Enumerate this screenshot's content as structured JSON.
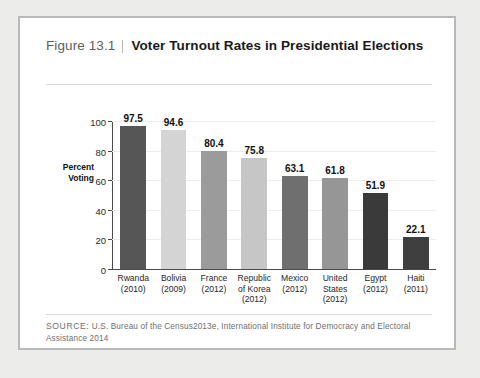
{
  "figure": {
    "number_label": "Figure 13.1",
    "title": "Voter Turnout Rates in Presidential Elections",
    "source_keyword": "SOURCE:",
    "source_text": " U.S. Bureau of the Census2013e, International Institute for Democracy and Electoral Assistance 2014"
  },
  "chart_data": {
    "type": "bar",
    "title": "Voter Turnout Rates in Presidential Elections",
    "xlabel": "",
    "ylabel": "Percent Voting",
    "ylabel_line1": "Percent",
    "ylabel_line2": "Voting",
    "ylim": [
      0,
      100
    ],
    "yticks": [
      0,
      20,
      40,
      60,
      80,
      100
    ],
    "ytick_labels": [
      "0",
      "20",
      "40",
      "60",
      "80",
      "100"
    ],
    "grid": true,
    "legend": "none",
    "categories": [
      "Rwanda (2010)",
      "Bolivia (2009)",
      "France (2012)",
      "Republic of Korea (2012)",
      "Mexico (2012)",
      "United States (2012)",
      "Egypt (2012)",
      "Haiti (2011)"
    ],
    "category_lines": [
      [
        "Rwanda",
        "(2010)"
      ],
      [
        "Bolivia",
        "(2009)"
      ],
      [
        "France",
        "(2012)"
      ],
      [
        "Republic",
        "of Korea",
        "(2012)"
      ],
      [
        "Mexico",
        "(2012)"
      ],
      [
        "United",
        "States",
        "(2012)"
      ],
      [
        "Egypt",
        "(2012)"
      ],
      [
        "Haiti",
        "(2011)"
      ]
    ],
    "values": [
      97.5,
      94.6,
      80.4,
      75.8,
      63.1,
      61.8,
      51.9,
      22.1
    ],
    "value_labels": [
      "97.5",
      "94.6",
      "80.4",
      "75.8",
      "63.1",
      "61.8",
      "51.9",
      "22.1"
    ],
    "bar_colors": [
      "#565656",
      "#d4d4d4",
      "#9b9b9b",
      "#c6c6c6",
      "#6f6f6f",
      "#969696",
      "#3a3a3a",
      "#3f3f3f"
    ]
  },
  "colors": {
    "page_background": "#ececeb",
    "card_background": "#ffffff",
    "card_border": "#b9b9b9",
    "axis": "#4a4a4a",
    "gridline": "#ededed",
    "source_text": "#6e6e6e"
  }
}
